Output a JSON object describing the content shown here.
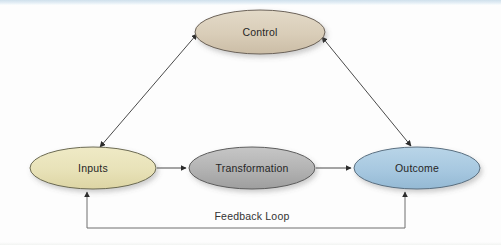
{
  "diagram": {
    "background_color": "#fdfdfd",
    "nodes": [
      {
        "id": "control",
        "label": "Control",
        "shape": "ellipse",
        "cx": 260,
        "cy": 32,
        "rx": 65,
        "ry": 22,
        "fill": "#d9cdb8",
        "stroke": "#6b6258",
        "text_color": "#262626"
      },
      {
        "id": "inputs",
        "label": "Inputs",
        "shape": "ellipse",
        "cx": 93,
        "cy": 168,
        "rx": 63,
        "ry": 21,
        "fill": "#e8e2b8",
        "stroke": "#6b6a52",
        "text_color": "#262626"
      },
      {
        "id": "transformation",
        "label": "Transformation",
        "shape": "ellipse",
        "cx": 252,
        "cy": 168,
        "rx": 63,
        "ry": 21,
        "fill": "#b4b4b4",
        "stroke": "#5c5c5c",
        "text_color": "#262626"
      },
      {
        "id": "outcome",
        "label": "Outcome",
        "shape": "ellipse",
        "cx": 417,
        "cy": 168,
        "rx": 63,
        "ry": 21,
        "fill": "#a7c8e0",
        "stroke": "#5a6f80",
        "text_color": "#262626"
      }
    ],
    "edges": [
      {
        "id": "inputs-control",
        "from": "inputs",
        "to": "control",
        "label": "",
        "arrow": "double",
        "stroke": "#4a4a4a"
      },
      {
        "id": "control-outcome",
        "from": "control",
        "to": "outcome",
        "label": "",
        "arrow": "double",
        "stroke": "#4a4a4a"
      },
      {
        "id": "inputs-transformation",
        "from": "inputs",
        "to": "transformation",
        "label": "",
        "arrow": "single",
        "stroke": "#4a4a4a"
      },
      {
        "id": "transformation-outcome",
        "from": "transformation",
        "to": "outcome",
        "label": "",
        "arrow": "single",
        "stroke": "#4a4a4a"
      },
      {
        "id": "feedback-loop",
        "from": "outcome",
        "to": "inputs",
        "label": "Feedback Loop",
        "arrow": "double",
        "stroke": "#6e6e6e"
      }
    ],
    "labels": {
      "feedback_loop": "Feedback Loop"
    }
  }
}
